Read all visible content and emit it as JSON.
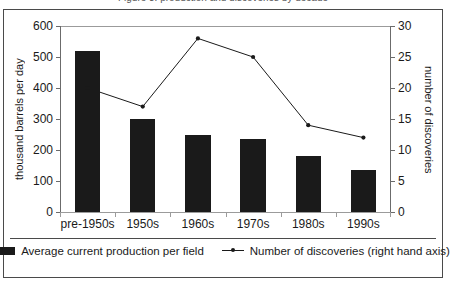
{
  "figure": {
    "caption_fragment": "Figure 3: production and discoveries by decade"
  },
  "chart_data": {
    "type": "bar",
    "title": "",
    "categories": [
      "pre-1950s",
      "1950s",
      "1960s",
      "1970s",
      "1980s",
      "1990s"
    ],
    "series": [
      {
        "name": "Average current production per field",
        "type": "bar",
        "axis": "left",
        "values": [
          520,
          300,
          250,
          235,
          180,
          135
        ],
        "color": "#1a1a1a"
      },
      {
        "name": "Number of discoveries (right hand axis)",
        "type": "line",
        "axis": "right",
        "values": [
          20,
          17,
          28,
          25,
          14,
          12
        ],
        "color": "#1a1a1a",
        "marker": "circle"
      }
    ],
    "xlabel": "",
    "ylabel": "thousand barrels per day",
    "y2label": "number of discoveries",
    "ylim": [
      0,
      600
    ],
    "y2lim": [
      0,
      30
    ],
    "yticks": [
      0,
      100,
      200,
      300,
      400,
      500,
      600
    ],
    "y2ticks": [
      0,
      5,
      10,
      15,
      20,
      25,
      30
    ],
    "grid": false,
    "legend_position": "bottom"
  },
  "legend": {
    "items": [
      {
        "label": "Average current production per field",
        "marker": "bar-swatch"
      },
      {
        "label": "Number of discoveries (right hand axis)",
        "marker": "line-marker"
      }
    ]
  }
}
